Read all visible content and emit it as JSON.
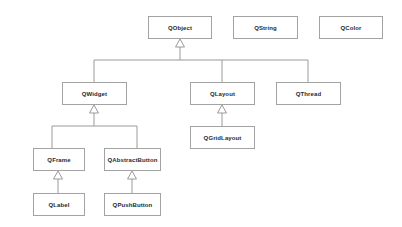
{
  "diagram": {
    "type": "uml-class-hierarchy",
    "classes": {
      "qobject": "QObject",
      "qstring": "QString",
      "qcolor": "QColor",
      "qwidget": "QWidget",
      "qlayout": "QLayout",
      "qthread": "QThread",
      "qgridlayout": "QGridLayout",
      "qframe": "QFrame",
      "qabstractbutton": "QAbstractButton",
      "qlabel": "QLabel",
      "qpushbutton": "QPushButton"
    },
    "inheritance": [
      {
        "child": "QWidget",
        "parent": "QObject"
      },
      {
        "child": "QLayout",
        "parent": "QObject"
      },
      {
        "child": "QThread",
        "parent": "QObject"
      },
      {
        "child": "QGridLayout",
        "parent": "QLayout"
      },
      {
        "child": "QFrame",
        "parent": "QWidget"
      },
      {
        "child": "QAbstractButton",
        "parent": "QWidget"
      },
      {
        "child": "QLabel",
        "parent": "QFrame"
      },
      {
        "child": "QPushButton",
        "parent": "QAbstractButton"
      }
    ],
    "colors": {
      "border": "#a3a3a3",
      "text": "#2a2a2a",
      "background": "#ffffff"
    }
  }
}
